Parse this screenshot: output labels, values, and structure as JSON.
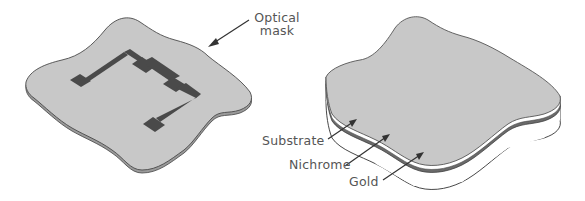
{
  "figure": {
    "left_panel": {
      "name": "Optical mask over pattern",
      "label": {
        "line1": "Optical",
        "line2": "mask"
      }
    },
    "right_panel": {
      "name": "Layered substrate",
      "labels": {
        "substrate": "Substrate",
        "nichrome": "Nichrome",
        "gold": "Gold"
      }
    }
  },
  "colors": {
    "mask_fill": "#c8c8c8",
    "mask_edge": "#5a5a5a",
    "pattern_fill": "#4a4a4a",
    "gold_layer": "#6a6a6a",
    "substrate_fill": "#ffffff",
    "outline": "#333333",
    "label_text": "#555555"
  }
}
